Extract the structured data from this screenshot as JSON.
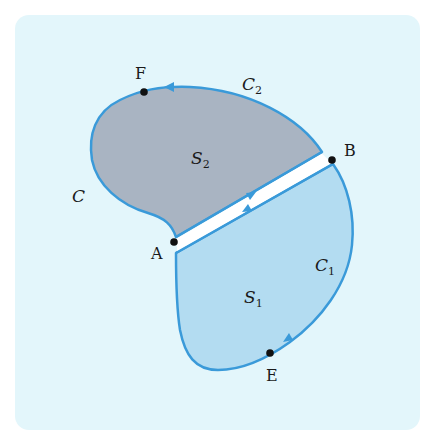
{
  "colors": {
    "background": "#e3f6fb",
    "outline": "#3a9ad9",
    "region_s1": "#b3dcf1",
    "region_s2": "#a9b4c2",
    "strip": "#ffffff",
    "point": "#111111"
  },
  "points": {
    "A": "A",
    "B": "B",
    "E": "E",
    "F": "F"
  },
  "curves": {
    "C": "C",
    "C1_base": "C",
    "C1_sub": "1",
    "C2_base": "C",
    "C2_sub": "2"
  },
  "regions": {
    "S1_base": "S",
    "S1_sub": "1",
    "S2_base": "S",
    "S2_sub": "2"
  }
}
